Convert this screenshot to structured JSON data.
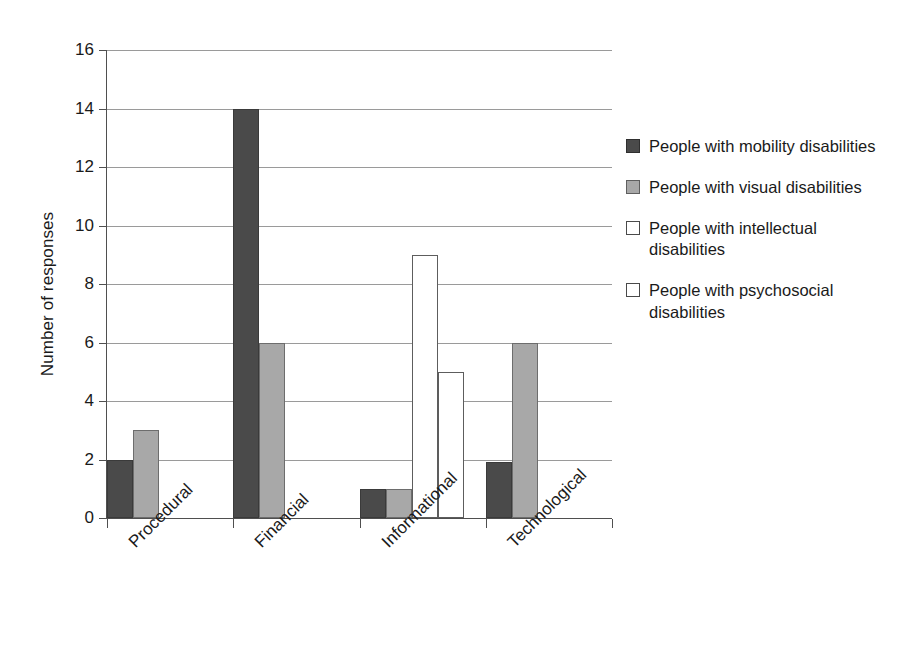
{
  "chart_data": {
    "type": "bar",
    "title": "",
    "subtitle": "",
    "xlabel": "",
    "ylabel": "Number of responses",
    "ylim": [
      0,
      16
    ],
    "ytick_step": 2,
    "yticks": [
      0,
      2,
      4,
      6,
      8,
      10,
      12,
      14,
      16
    ],
    "grid": true,
    "grid_axis": "y",
    "legend_position": "right",
    "categories": [
      "Procedural",
      "Financial",
      "Informational",
      "Technological"
    ],
    "series": [
      {
        "name": "People with mobility disabilities",
        "color": "#4a4a4a",
        "values": [
          2,
          14,
          1,
          1.9
        ]
      },
      {
        "name": "People with visual disabilities",
        "color": "#a8a8a8",
        "values": [
          3,
          6,
          1,
          6
        ]
      },
      {
        "name": "People with intellectual disabilities",
        "color": "#ffffff",
        "values": [
          0,
          0,
          9,
          0
        ]
      },
      {
        "name": "People with psychosocial disabilities",
        "color": "#ffffff",
        "values": [
          0,
          0,
          5,
          0
        ]
      }
    ]
  },
  "axis": {
    "y_title": "Number of responses",
    "y_tick_labels": [
      "16",
      "14",
      "12",
      "10",
      "8",
      "6",
      "4",
      "2",
      "0"
    ],
    "x_tick_labels": [
      "Procedural",
      "Financial",
      "Informational",
      "Technological"
    ]
  },
  "legend": {
    "items": [
      {
        "label": "People with mobility disabilities",
        "swatch": "dark"
      },
      {
        "label": "People with visual disabilities",
        "swatch": "mid"
      },
      {
        "label": "People with intellectual disabilities",
        "swatch": "light"
      },
      {
        "label": "People with psychosocial disabilities",
        "swatch": "light"
      }
    ]
  },
  "colors": {
    "series_mobility": "#4a4a4a",
    "series_visual": "#a8a8a8",
    "series_intellectual": "#ffffff",
    "series_psychosocial": "#ffffff",
    "gridline": "#9a9a9a",
    "axis": "#4f4f4f",
    "text": "#1a1a1a",
    "background": "#ffffff"
  }
}
